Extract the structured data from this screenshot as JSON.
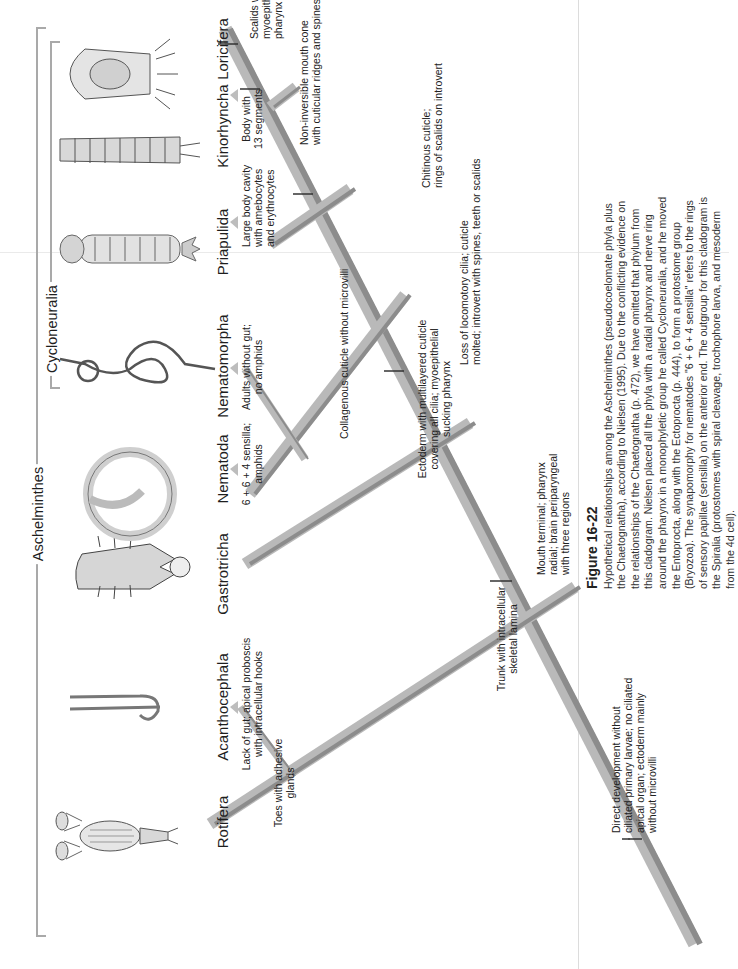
{
  "figure": {
    "number": "Figure 16-22",
    "caption": "Hypothetical relationships among the Aschelminthes (pseudocoelomate phyla plus the Chaetognatha), according to Nielsen (1995). Due to the conflicting evidence on the relationships of the Chaetognatha (p. 472), we have omitted that phylum from this cladogram. Nielsen placed all the phyla with a radial pharynx and nerve ring around the pharynx in a monophyletic group he called Cycloneuralia, and he moved the Entoprocta, along with the Ectoprocta (p. 444), to form a protostome group (Bryozoa). The synapomorphy for nematodes \"6 + 6 + 4 sensilla\" refers to the rings of sensory papillae (sensilla) on the anterior end. The outgroup for this cladogram is the Spiralia (protostomes with spiral cleavage, trochophore larva, and mesoderm from the 4d cell).",
    "orientation": "rotated 90° counter-clockwise"
  },
  "groups": {
    "outer": "Aschelminthes",
    "inner": "Cycloneuralia"
  },
  "taxa": [
    {
      "name": "Rotifera",
      "icon": "rotifer-illustration"
    },
    {
      "name": "Acanthocephala",
      "icon": "acanthocephalan-worm-illustration"
    },
    {
      "name": "Gastrotricha",
      "icon": "gastrotrich-illustration"
    },
    {
      "name": "Nematoda",
      "icon": "coiled-nematode-illustration"
    },
    {
      "name": "Nematomorpha",
      "icon": "knotted-hairworm-illustration"
    },
    {
      "name": "Priapulida",
      "icon": "priapulid-illustration"
    },
    {
      "name": "Kinorhyncha",
      "icon": "segmented-kinorhynch-illustration"
    },
    {
      "name": "Loricifera",
      "icon": "lorica-loriciferan-illustration"
    }
  ],
  "characters": {
    "root": [
      "Direct development without",
      "ciliated primary larvae; no ciliated",
      "apical organ; ectoderm mainly",
      "without microvilli"
    ],
    "trunk_lamina": [
      "Trunk with intracellular",
      "skeletal lamina"
    ],
    "rotifera": [
      "Toes with adhesive",
      "glands"
    ],
    "acanthocephala": [
      "Lack of gut; apical proboscis",
      "with intracellular hooks"
    ],
    "mouth_terminal": [
      "Mouth terminal; pharynx",
      "radial; brain periparyngeal",
      "with three regions"
    ],
    "ectoderm_cuticle": [
      "Ectoderm with multilayered cuticle",
      "covering all cilia; myoepithelial",
      "sucking pharynx"
    ],
    "loss_cilia": [
      "Loss of locomotory cilia; cuticle",
      "molted; introvert with spines, teeth or scalids"
    ],
    "collagenous": [
      "Collagenous cuticle without microvilli"
    ],
    "nematoda": [
      "6 + 6 + 4 sensilla;",
      "amphids"
    ],
    "nematomorpha": [
      "Adults without gut;",
      "no amphids"
    ],
    "chitinous": [
      "Chitinous cuticle;",
      "rings of scalids on introvert"
    ],
    "priapulida": [
      "Large body cavity",
      "with amebocytes",
      "and erythrocytes"
    ],
    "kinorhyncha": [
      "Body with",
      "13 segments"
    ],
    "mouth_cone": [
      "Non-inversible mouth cone",
      "with cuticular ridges and spines"
    ],
    "loricifera": [
      "Scalids with muscles;",
      "myoepithelial sucking",
      "pharynx"
    ]
  },
  "colors": {
    "branch_light": "#b9b9b9",
    "branch_dark": "#8c8c8c",
    "bracket": "#a9a9a9",
    "text": "#1e1e1e"
  }
}
